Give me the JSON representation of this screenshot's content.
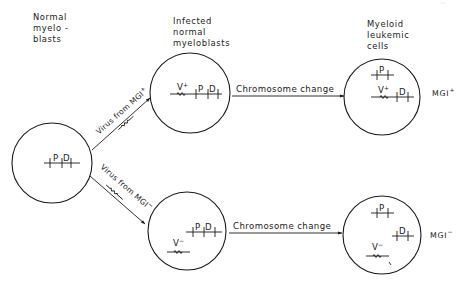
{
  "figure": {
    "column_headers": [
      {
        "lines": [
          "Normal",
          "myelo -",
          "blasts"
        ],
        "x": 33,
        "y": 20
      },
      {
        "lines": [
          "Infected",
          "normal",
          "myeloblasts"
        ],
        "x": 173,
        "y": 22
      },
      {
        "lines": [
          "Myeloid",
          "leukemic",
          "cells"
        ],
        "x": 366,
        "y": 25
      }
    ],
    "cells": [
      {
        "id": "normal-myeloblast",
        "cx": 52,
        "cy": 163,
        "r": 40
      },
      {
        "id": "infected-mgi-plus",
        "cx": 190,
        "cy": 93,
        "r": 40
      },
      {
        "id": "infected-mgi-minus",
        "cx": 187,
        "cy": 231,
        "r": 39
      },
      {
        "id": "leukemic-mgi-plus",
        "cx": 382,
        "cy": 97,
        "r": 38
      },
      {
        "id": "leukemic-mgi-minus",
        "cx": 382,
        "cy": 235,
        "r": 39
      }
    ],
    "gene_labels": {
      "P": "P",
      "D": "D",
      "V": "V"
    },
    "virus_signs": {
      "plus": "+",
      "minus": "−"
    },
    "transitions": {
      "virus_from_mgi_plus": {
        "text": "Virus from MGI",
        "sign": "+"
      },
      "virus_from_mgi_minus": {
        "text": "Virus from MGI",
        "sign": "−"
      },
      "chromosome_change_top": "Chromosome change",
      "chromosome_change_bottom": "Chromosome change"
    },
    "outcomes": {
      "top": {
        "text": "MGI",
        "sign": "+"
      },
      "bottom": {
        "text": "MGI",
        "sign": "−"
      }
    },
    "page_corner_mark": "···"
  }
}
